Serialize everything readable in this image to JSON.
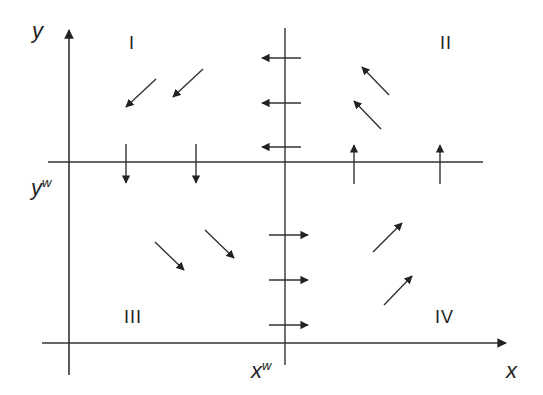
{
  "diagram": {
    "type": "phase-diagram",
    "axes": {
      "x_label": "x",
      "y_label": "y",
      "x_isocline_label": "x",
      "x_isocline_sup": "w",
      "y_isocline_label": "y",
      "y_isocline_sup": "w"
    },
    "quadrants": [
      {
        "id": "I",
        "label": "I",
        "direction": "down-left"
      },
      {
        "id": "II",
        "label": "II",
        "direction": "up-left"
      },
      {
        "id": "III",
        "label": "III",
        "direction": "down-right"
      },
      {
        "id": "IV",
        "label": "IV",
        "direction": "up-right"
      }
    ],
    "isocline_arrows": {
      "on_x_w_above": "left",
      "on_x_w_below": "right",
      "on_y_w_left": "down",
      "on_y_w_right": "up"
    },
    "colors": {
      "line": "#333333",
      "background": "#ffffff"
    }
  }
}
